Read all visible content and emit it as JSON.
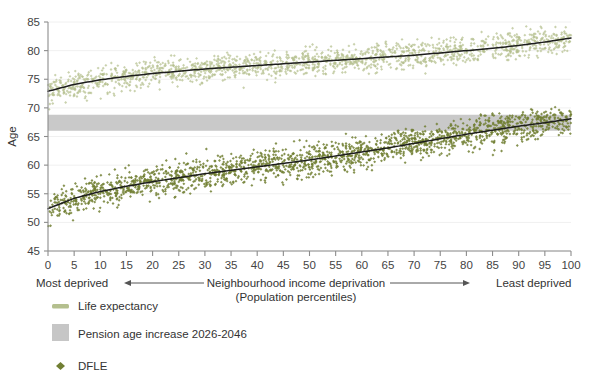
{
  "chart_data": {
    "type": "scatter",
    "title": "",
    "xlabel": "Neighbourhood income deprivation",
    "xlabel_sub": "(Population percentiles)",
    "ylabel": "Age",
    "xlim": [
      0,
      100
    ],
    "ylim": [
      45,
      85
    ],
    "xticks": [
      0,
      5,
      10,
      15,
      20,
      25,
      30,
      35,
      40,
      45,
      50,
      55,
      60,
      65,
      70,
      75,
      80,
      85,
      90,
      95,
      100
    ],
    "yticks": [
      45,
      50,
      55,
      60,
      65,
      70,
      75,
      80,
      85
    ],
    "grid": "horizontal",
    "legend_position": "below-left",
    "x_axis_left_annotation": "Most deprived",
    "x_axis_right_annotation": "Least deprived",
    "series": [
      {
        "name": "Life expectancy",
        "kind": "scatter-cloud-with-trend",
        "point_color": "#b4bf8e",
        "trend_color": "#1d1d1d",
        "scatter_spread_years": 2.6,
        "n_points": 1600,
        "x": [
          0,
          5,
          10,
          15,
          20,
          25,
          30,
          35,
          40,
          45,
          50,
          55,
          60,
          65,
          70,
          75,
          80,
          85,
          90,
          95,
          100
        ],
        "values": [
          72.9,
          74.1,
          74.9,
          75.5,
          76.0,
          76.4,
          76.8,
          77.1,
          77.4,
          77.7,
          78.0,
          78.3,
          78.6,
          78.9,
          79.2,
          79.6,
          80.0,
          80.4,
          80.9,
          81.5,
          82.2
        ]
      },
      {
        "name": "DFLE",
        "kind": "scatter-cloud-with-trend",
        "point_color": "#717f33",
        "trend_color": "#1d1d1d",
        "scatter_spread_years": 3.0,
        "n_points": 1900,
        "x": [
          0,
          5,
          10,
          15,
          20,
          25,
          30,
          35,
          40,
          45,
          50,
          55,
          60,
          65,
          70,
          75,
          80,
          85,
          90,
          95,
          100
        ],
        "values": [
          52.4,
          54.2,
          55.4,
          56.3,
          57.1,
          57.8,
          58.5,
          59.1,
          59.7,
          60.3,
          60.9,
          61.6,
          62.3,
          63.0,
          63.8,
          64.6,
          65.4,
          66.1,
          66.8,
          67.4,
          68.1
        ]
      }
    ],
    "bands": [
      {
        "name": "Pension age increase 2026-2046",
        "color": "#c6c6c6",
        "y_from": 66.0,
        "y_to": 68.8
      }
    ]
  },
  "legend": {
    "items": [
      {
        "label": "Life expectancy",
        "marker": "line-swatch",
        "color": "#b4bf8e"
      },
      {
        "label": "Pension age increase 2026-2046",
        "marker": "square-swatch",
        "color": "#c6c6c6"
      },
      {
        "label": "DFLE",
        "marker": "diamond",
        "color": "#717f33"
      }
    ]
  },
  "colors": {
    "life_expectancy_points": "#b4bf8e",
    "dfle_points": "#717f33",
    "trend_line": "#1d1d1d",
    "pension_band": "#c6c6c6",
    "axis": "#8c8c8c",
    "gridline": "#f0f0f0",
    "text": "#333333"
  }
}
